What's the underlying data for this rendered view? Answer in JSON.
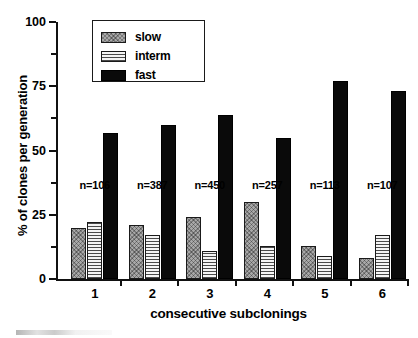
{
  "chart_data": {
    "type": "bar",
    "title": "",
    "xlabel": "consecutive subclonings",
    "ylabel": "% of clones per generation",
    "categories": [
      "1",
      "2",
      "3",
      "4",
      "5",
      "6"
    ],
    "ylim": [
      0,
      100
    ],
    "yticks": [
      0,
      25,
      50,
      75,
      100
    ],
    "ytick_labels": [
      "0",
      "25",
      "50",
      "75",
      "100"
    ],
    "yminor_ticks": [
      12.5,
      37.5,
      62.5,
      87.5
    ],
    "grid": false,
    "legend_position": "top-left-inside",
    "series": [
      {
        "name": "slow",
        "key": "slow",
        "values": [
          20,
          21,
          24,
          30,
          13,
          8
        ]
      },
      {
        "name": "interm",
        "key": "interm",
        "values": [
          22,
          17,
          11,
          13,
          9,
          17
        ]
      },
      {
        "name": "fast",
        "key": "fast",
        "values": [
          57,
          60,
          64,
          55,
          77,
          73
        ]
      }
    ],
    "annotations": [
      {
        "category": "1",
        "text": "n=106",
        "value": 36
      },
      {
        "category": "2",
        "text": "n=387",
        "value": 36
      },
      {
        "category": "3",
        "text": "n=450",
        "value": 36
      },
      {
        "category": "4",
        "text": "n=257",
        "value": 36
      },
      {
        "category": "5",
        "text": "n=113",
        "value": 36
      },
      {
        "category": "6",
        "text": "n=107",
        "value": 36
      }
    ]
  },
  "legend": {
    "items": [
      {
        "label": "slow",
        "key": "slow"
      },
      {
        "label": "interm",
        "key": "interm"
      },
      {
        "label": "fast",
        "key": "fast"
      }
    ]
  },
  "colors": {
    "slow": "#a8a8a8",
    "interm": "#f2f2f2",
    "fast": "#0a0a0a",
    "axis": "#111111",
    "background": "#ffffff"
  }
}
